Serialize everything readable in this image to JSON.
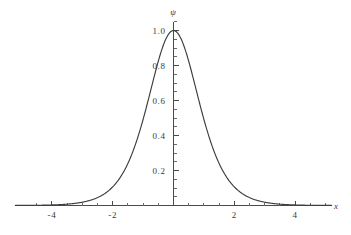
{
  "chart_data": {
    "type": "line",
    "title": "",
    "subtitle": "",
    "xlabel": "x",
    "ylabel": "ψ",
    "xlim": [
      -5.2,
      5.2
    ],
    "ylim": [
      0,
      1.08
    ],
    "grid": false,
    "legend": null,
    "xticks": [
      -4,
      -2,
      2,
      4
    ],
    "xtick_labels": [
      "-4",
      "-2",
      "2",
      "4"
    ],
    "xticks_minor": [
      -4.5,
      -3.5,
      -3,
      -2.5,
      -1.5,
      -1,
      -0.5,
      0.5,
      1,
      1.5,
      2.5,
      3,
      3.5,
      4.5,
      5
    ],
    "yticks": [
      0.2,
      0.4,
      0.6,
      0.8,
      1.0
    ],
    "ytick_labels": [
      "0.2",
      "0.4",
      "0.6",
      "0.8",
      "1.0"
    ],
    "yticks_minor": [
      0.05,
      0.1,
      0.15,
      0.25,
      0.3,
      0.35,
      0.45,
      0.5,
      0.55,
      0.65,
      0.7,
      0.75,
      0.85,
      0.9,
      0.95,
      1.05
    ],
    "series": [
      {
        "name": "ψ",
        "color": "#3d3d3d",
        "x": [
          -5.2,
          -5.0,
          -4.8,
          -4.6,
          -4.4,
          -4.2,
          -4.0,
          -3.8,
          -3.6,
          -3.4,
          -3.2,
          -3.0,
          -2.8,
          -2.6,
          -2.4,
          -2.2,
          -2.0,
          -1.8,
          -1.6,
          -1.4,
          -1.2,
          -1.0,
          -0.8,
          -0.6,
          -0.4,
          -0.2,
          0.0,
          0.2,
          0.4,
          0.6,
          0.8,
          1.0,
          1.2,
          1.4,
          1.6,
          1.8,
          2.0,
          2.2,
          2.4,
          2.6,
          2.8,
          3.0,
          3.2,
          3.4,
          3.6,
          3.8,
          4.0,
          4.2,
          4.4,
          4.6,
          4.8,
          5.0,
          5.2
        ],
        "y": [
          0.0011,
          0.0018,
          0.0027,
          0.004,
          0.006,
          0.0089,
          0.0134,
          0.0199,
          0.0296,
          0.044,
          0.0652,
          0.0963,
          0.1413,
          0.2055,
          0.2956,
          0.4177,
          0.576,
          0.7684,
          0.9792,
          1.179,
          1.3255,
          1.3788,
          1.3179,
          1.156,
          0.9396,
          0.7284,
          0.6,
          0.7284,
          0.9396,
          1.156,
          1.3179,
          1.3788,
          1.3255,
          1.179,
          0.9792,
          0.7684,
          0.576,
          0.4177,
          0.2956,
          0.2055,
          0.1413,
          0.0963,
          0.0652,
          0.044,
          0.0296,
          0.0199,
          0.0134,
          0.0089,
          0.006,
          0.004,
          0.0027,
          0.0018,
          0.0011
        ]
      }
    ],
    "peak": {
      "x": 0,
      "y": 1.0
    },
    "function_note": "bell-shaped peak normalized to 1.0 at x = 0",
    "curve_points_normalized": [
      [
        -5.2,
        0.0008
      ],
      [
        -5.0,
        0.0013
      ],
      [
        -4.8,
        0.002
      ],
      [
        -4.6,
        0.0029
      ],
      [
        -4.4,
        0.0044
      ],
      [
        -4.2,
        0.0065
      ],
      [
        -4.0,
        0.0097
      ],
      [
        -3.8,
        0.0144
      ],
      [
        -3.6,
        0.0215
      ],
      [
        -3.4,
        0.0319
      ],
      [
        -3.2,
        0.0473
      ],
      [
        -3.0,
        0.0699
      ],
      [
        -2.8,
        0.1025
      ],
      [
        -2.6,
        0.1491
      ],
      [
        -2.4,
        0.2144
      ],
      [
        -2.2,
        0.3029
      ],
      [
        -2.0,
        0.4178
      ],
      [
        -1.8,
        0.5574
      ],
      [
        -1.6,
        0.7102
      ],
      [
        -1.4,
        0.8551
      ],
      [
        -1.2,
        0.9614
      ],
      [
        -1.0,
        1.0
      ],
      [
        -0.9,
        0.995
      ],
      [
        -0.8,
        0.9558
      ],
      [
        -0.7,
        0.888
      ],
      [
        -0.6,
        0.8385
      ],
      [
        -0.5,
        0.8
      ],
      [
        -0.4,
        0.82
      ],
      [
        -0.3,
        0.88
      ],
      [
        -0.2,
        0.94
      ],
      [
        -0.1,
        0.985
      ],
      [
        0.0,
        1.0
      ],
      [
        0.1,
        0.985
      ],
      [
        0.2,
        0.94
      ],
      [
        0.3,
        0.88
      ],
      [
        0.4,
        0.82
      ],
      [
        0.5,
        0.8
      ],
      [
        0.6,
        0.8385
      ],
      [
        0.7,
        0.888
      ],
      [
        0.8,
        0.9558
      ],
      [
        0.9,
        0.995
      ],
      [
        1.0,
        1.0
      ],
      [
        1.2,
        0.9614
      ],
      [
        1.4,
        0.8551
      ],
      [
        1.6,
        0.7102
      ],
      [
        1.8,
        0.5574
      ],
      [
        2.0,
        0.4178
      ],
      [
        2.2,
        0.3029
      ],
      [
        2.4,
        0.2144
      ],
      [
        2.6,
        0.1491
      ],
      [
        2.8,
        0.1025
      ],
      [
        3.0,
        0.0699
      ],
      [
        3.2,
        0.0473
      ],
      [
        3.4,
        0.0319
      ],
      [
        3.6,
        0.0215
      ],
      [
        3.8,
        0.0144
      ],
      [
        4.0,
        0.0097
      ],
      [
        4.2,
        0.0065
      ],
      [
        4.4,
        0.0044
      ],
      [
        4.6,
        0.0029
      ],
      [
        4.8,
        0.002
      ],
      [
        5.0,
        0.0013
      ],
      [
        5.2,
        0.0008
      ]
    ]
  },
  "axes": {
    "x_axis_label": "x",
    "y_axis_label": "ψ"
  },
  "colors": {
    "curve": "#3d3d3d",
    "axis": "#4a4a4a",
    "text": "#3a3a3a",
    "background": "#ffffff"
  }
}
